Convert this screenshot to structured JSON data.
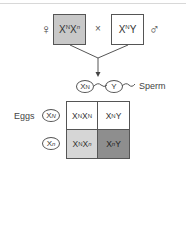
{
  "parents": {
    "female_symbol": "♀",
    "male_symbol": "♂",
    "cross_symbol": "×",
    "female_genotype": {
      "base1": "X",
      "sup1": "N",
      "base2": "X",
      "sup2": "n"
    },
    "male_genotype": {
      "base1": "X",
      "sup1": "N",
      "base2": "Y",
      "sup2": ""
    },
    "female_box_color": "#c8c8c8",
    "male_box_color": "#ffffff"
  },
  "gametes": {
    "sperm_label": "Sperm",
    "eggs_label": "Eggs",
    "sperm": [
      {
        "base": "X",
        "sup": "N"
      },
      {
        "base": "Y",
        "sup": ""
      }
    ],
    "eggs": [
      {
        "base": "X",
        "sup": "N"
      },
      {
        "base": "X",
        "sup": "n"
      }
    ]
  },
  "punnett": {
    "cells": [
      [
        {
          "parts": [
            {
              "b": "X",
              "s": "N"
            },
            {
              "b": "X",
              "s": "N"
            }
          ],
          "color": "#ffffff"
        },
        {
          "parts": [
            {
              "b": "X",
              "s": "N"
            },
            {
              "b": "Y",
              "s": ""
            }
          ],
          "color": "#ffffff"
        }
      ],
      [
        {
          "parts": [
            {
              "b": "X",
              "s": "N"
            },
            {
              "b": "X",
              "s": "n"
            }
          ],
          "color": "#d6d6d6"
        },
        {
          "parts": [
            {
              "b": "X",
              "s": "n"
            },
            {
              "b": "Y",
              "s": ""
            }
          ],
          "color": "#8e8e8e"
        }
      ]
    ]
  }
}
